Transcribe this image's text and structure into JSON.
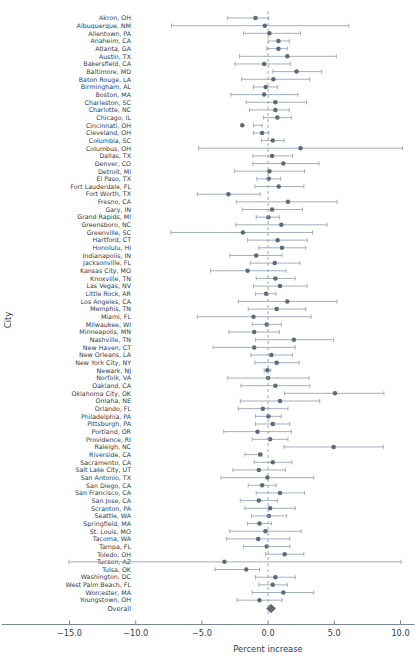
{
  "chart_data": {
    "type": "scatter",
    "plot_style": "forest-plot",
    "title": "",
    "xlabel": "Percent increase",
    "ylabel": "City",
    "xlim": [
      -15.0,
      10.0
    ],
    "xticks": [
      -15.0,
      -10.0,
      -5.0,
      0.0,
      5.0,
      10.0
    ],
    "xticklabels": [
      "−15.0",
      "−10.0",
      "−5.0",
      "0.0",
      "5.0",
      "10.0"
    ],
    "grid": false,
    "legend": null,
    "reference_line": 0.0,
    "point_color": "#5c6b7a",
    "interval_color": "#9aa6b2",
    "axis_color": "#7a8894",
    "categories": [
      "Akron, OH",
      "Albuquerque, NM",
      "Allentown, PA",
      "Anaheim, CA",
      "Atlanta, GA",
      "Austin, TX",
      "Bakersfield, CA",
      "Baltimore, MD",
      "Baton Rouge, LA",
      "Birmingham, AL",
      "Boston, MA",
      "Charleston, SC",
      "Charlotte, NC",
      "Chicago, IL",
      "Cincinnati, OH",
      "Cleveland, OH",
      "Columbia, SC",
      "Columbus, OH",
      "Dallas, TX",
      "Denver, CO",
      "Detroit, MI",
      "El Paso, TX",
      "Fort Lauderdale, FL",
      "Fort Worth, TX",
      "Fresno, CA",
      "Gary, IN",
      "Grand Rapids, MI",
      "Greensboro, NC",
      "Greenville, SC",
      "Hartford, CT",
      "Honolulu, HI",
      "Indianapolis, IN",
      "Jacksonville, FL",
      "Kansas City, MO",
      "Knoxville, TN",
      "Las Vegas, NV",
      "Little Rock, AR",
      "Los Angeles, CA",
      "Memphis, TN",
      "Miami, FL",
      "Milwaukee, WI",
      "Minneapolis, MN",
      "Nashville, TN",
      "New Haven, CT",
      "New Orleans, LA",
      "New York City, NY",
      "Newark, NJ",
      "Norfolk, VA",
      "Oakland, CA",
      "Oklahoma City, OK",
      "Omaha, NE",
      "Orlando, FL",
      "Philadelphia, PA",
      "Pittsburgh, PA",
      "Portland, OR",
      "Providence, RI",
      "Raleigh, NC",
      "Riverside, CA",
      "Sacramento, CA",
      "Salt Lake City, UT",
      "San Antonio, TX",
      "San Diego, CA",
      "San Francisco, CA",
      "San Jose, CA",
      "Scranton, PA",
      "Seattle, WA",
      "Springfield, MA",
      "St. Louis, MO",
      "Tacoma, WA",
      "Tampa, FL",
      "Toledo, OH",
      "Tucson, AZ",
      "Tulsa, OK",
      "Washington, DC",
      "West Palm Beach, FL",
      "Worcester, MA",
      "Youngstown, OH"
    ],
    "estimates": [
      -0.95,
      -0.25,
      0.1,
      0.78,
      0.78,
      1.45,
      -0.3,
      2.15,
      0.4,
      -0.18,
      -0.3,
      0.55,
      0.55,
      0.7,
      -1.95,
      -0.45,
      0.35,
      2.45,
      0.3,
      1.15,
      0.1,
      0.05,
      0.8,
      -3.0,
      1.5,
      0.3,
      0.02,
      1.0,
      -1.9,
      0.72,
      1.05,
      -0.9,
      0.5,
      -1.55,
      0.55,
      0.9,
      -0.15,
      1.45,
      0.65,
      -1.1,
      -0.1,
      -1.05,
      1.95,
      -1.05,
      0.25,
      0.65,
      -0.05,
      0.0,
      0.55,
      5.05,
      0.9,
      -0.4,
      0.02,
      0.35,
      -0.8,
      0.15,
      4.95,
      -0.6,
      0.35,
      -0.7,
      -0.05,
      -0.45,
      0.9,
      -0.7,
      0.15,
      0.05,
      -0.65,
      -0.2,
      -0.75,
      -0.1,
      1.25,
      -3.3,
      -1.65,
      0.55,
      0.35,
      1.15,
      -0.65
    ],
    "ci_low": [
      -3.05,
      -7.3,
      -1.85,
      0.02,
      -0.1,
      -2.15,
      -2.5,
      0.35,
      -2.0,
      -1.1,
      -2.8,
      -1.65,
      -1.4,
      -0.35,
      -1.1,
      -1.1,
      -0.5,
      -5.25,
      -1.15,
      -1.15,
      -2.55,
      -0.85,
      -1.0,
      -5.35,
      -2.4,
      -1.95,
      -0.9,
      -2.45,
      -7.35,
      -1.55,
      -0.7,
      -2.9,
      -1.35,
      -4.35,
      -0.9,
      -1.1,
      -0.95,
      -2.25,
      -1.5,
      -5.35,
      -1.2,
      -2.95,
      -0.95,
      -4.15,
      -1.3,
      -1.0,
      -0.3,
      -3.05,
      -2.05,
      1.25,
      -2.1,
      -2.25,
      -0.95,
      -0.95,
      -3.35,
      -1.2,
      1.2,
      -1.75,
      -1.05,
      -2.65,
      -3.55,
      -1.5,
      -0.9,
      -2.1,
      -1.75,
      -1.25,
      -1.55,
      -2.9,
      -3.15,
      -1.85,
      -0.2,
      -15.05,
      -4.0,
      -0.95,
      -0.7,
      -1.2,
      -2.35
    ],
    "ci_high": [
      0.05,
      6.1,
      2.45,
      1.6,
      1.45,
      5.15,
      1.7,
      4.05,
      3.15,
      0.7,
      2.25,
      2.9,
      1.6,
      1.75,
      -0.45,
      0.05,
      1.2,
      10.15,
      1.85,
      3.85,
      2.75,
      0.95,
      2.7,
      -0.6,
      5.2,
      2.6,
      0.85,
      4.45,
      3.35,
      2.95,
      2.85,
      1.05,
      2.4,
      1.35,
      2.05,
      2.95,
      0.6,
      5.2,
      2.85,
      3.25,
      1.0,
      0.85,
      4.95,
      2.05,
      1.85,
      2.35,
      0.2,
      3.1,
      3.15,
      8.75,
      3.9,
      1.5,
      1.0,
      1.65,
      1.75,
      1.5,
      8.7,
      -0.45,
      1.8,
      1.3,
      3.45,
      0.6,
      2.75,
      0.7,
      2.05,
      1.4,
      0.25,
      2.5,
      1.65,
      1.65,
      2.7,
      10.05,
      -0.65,
      2.05,
      1.45,
      3.45,
      1.05
    ],
    "overall": {
      "label": "Overall",
      "estimate": 0.22,
      "ci_low": -0.12,
      "ci_high": 0.56,
      "marker": "diamond"
    }
  }
}
